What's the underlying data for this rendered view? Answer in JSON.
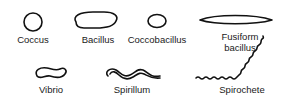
{
  "diagram": {
    "shapes": [
      {
        "name": "coccus",
        "label": "Coccus"
      },
      {
        "name": "bacillus",
        "label": "Bacillus"
      },
      {
        "name": "coccobacillus",
        "label": "Coccobacillus"
      },
      {
        "name": "fusiform-bacillus",
        "label_line1": "Fusiform",
        "label_line2": "bacillus"
      },
      {
        "name": "vibrio",
        "label": "Vibrio"
      },
      {
        "name": "spirillum",
        "label": "Spirillum"
      },
      {
        "name": "spirochete",
        "label": "Spirochete"
      }
    ]
  }
}
